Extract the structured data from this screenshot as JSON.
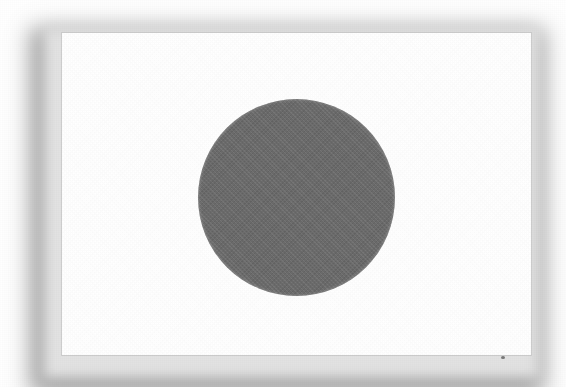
{
  "image": {
    "kind": "flag-illustration",
    "subject": "Flag of Japan",
    "rendering": "grayscale scanned print",
    "background_color": "#ffffff",
    "width": 566,
    "height": 387
  },
  "flag": {
    "name": "Flag of Japan",
    "alt_text": "Flag of Japan: a white rectangular field with a large grey disc slightly left of centre",
    "field_color": "#ffffff",
    "border_color": "#c6c6c6",
    "x": 62,
    "y": 33,
    "width": 469,
    "height": 322,
    "emblem": {
      "name": "Hinomaru sun disc",
      "shape": "circle",
      "color": "#6d6d6d",
      "center_x": 296,
      "center_y": 197,
      "diameter": 197
    }
  },
  "shadow": {
    "name": "drop-shadow",
    "color": "#9a9a9a",
    "direction": "lower-left",
    "blur": 16
  },
  "artifacts": {
    "scan_speck": {
      "name": "scan-speck",
      "x": 501,
      "y": 356
    }
  }
}
